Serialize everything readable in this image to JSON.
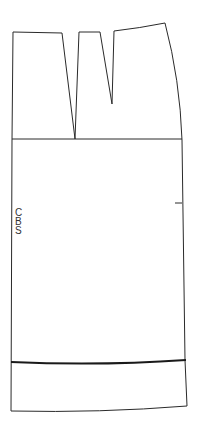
{
  "diagram": {
    "type": "sewing-pattern-piece",
    "piece": "skirt back",
    "label_letters": [
      "C",
      "B",
      "S"
    ],
    "line_color": "#2a2a2a",
    "background": "#ffffff",
    "features": [
      "waistline",
      "two darts",
      "hip line",
      "side notch",
      "hem fold line",
      "hem edge"
    ]
  }
}
